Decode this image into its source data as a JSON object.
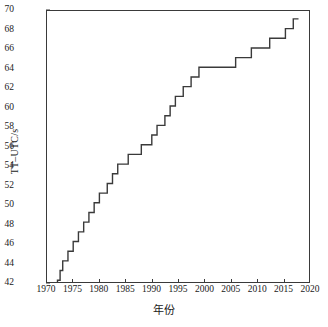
{
  "chart": {
    "type": "step-line",
    "ylabel": "TT–UTC/s",
    "xlabel": "年份",
    "line_color": "#3a3a3a",
    "frame_color": "#3a3a3a",
    "background": "#ffffff"
  },
  "axes": {
    "x": {
      "min": 1970,
      "max": 2020,
      "tick_step": 5,
      "ticks": [
        1970,
        1975,
        1980,
        1985,
        1990,
        1995,
        2000,
        2005,
        2010,
        2015,
        2020
      ],
      "tick_labels": [
        "1970",
        "1975",
        "1980",
        "1985",
        "1990",
        "1995",
        "2000",
        "2005",
        "2010",
        "2015",
        "2020"
      ]
    },
    "y": {
      "min": 42,
      "max": 70,
      "tick_step": 2,
      "ticks": [
        42,
        44,
        46,
        48,
        50,
        52,
        54,
        56,
        58,
        60,
        62,
        64,
        66,
        68,
        70
      ],
      "tick_labels": [
        "42",
        "44",
        "46",
        "48",
        "50",
        "52",
        "54",
        "56",
        "58",
        "60",
        "62",
        "64",
        "66",
        "68",
        "70"
      ]
    }
  },
  "chart_data": {
    "type": "line",
    "title": "",
    "subtitle": "",
    "xlabel": "年份",
    "ylabel": "TT–UTC/s",
    "xlim": [
      1970,
      2020
    ],
    "ylim": [
      42,
      70
    ],
    "grid": false,
    "legend": "none",
    "step": "post",
    "series": [
      {
        "name": "TT-UTC",
        "x": [
          1972.0,
          1972.5,
          1973.0,
          1974.0,
          1975.0,
          1976.0,
          1977.0,
          1978.0,
          1979.0,
          1980.0,
          1981.5,
          1982.5,
          1983.5,
          1985.5,
          1988.0,
          1990.0,
          1991.0,
          1992.5,
          1993.5,
          1994.5,
          1996.0,
          1997.5,
          1999.0,
          2006.0,
          2009.0,
          2012.5,
          2015.5,
          2017.0,
          2018.0
        ],
        "y": [
          42.184,
          43.184,
          44.184,
          45.184,
          46.184,
          47.184,
          48.184,
          49.184,
          50.184,
          51.184,
          52.184,
          53.184,
          54.184,
          55.184,
          56.184,
          57.184,
          58.184,
          59.184,
          60.184,
          61.184,
          62.184,
          63.184,
          64.184,
          65.184,
          66.184,
          67.184,
          68.184,
          69.184,
          69.184
        ]
      }
    ]
  }
}
